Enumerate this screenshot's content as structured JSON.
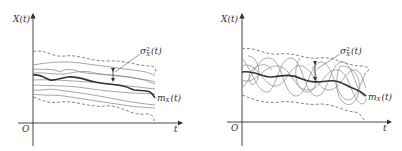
{
  "panels": [
    {
      "id": "left",
      "description": "Slowly varying sample functions of a random process",
      "y_axis_label": "X(t)",
      "x_axis_label": "t",
      "origin_label": "O",
      "variance_label": {
        "base": "σ",
        "sup": "2",
        "sub": "X",
        "arg": "(t)"
      },
      "mean_label": {
        "base": "m",
        "sub": "X",
        "arg": "(t)"
      },
      "colors": {
        "axis": "#333333",
        "sample": "#777777",
        "mean": "#333333",
        "envelope": "#666666"
      }
    },
    {
      "id": "right",
      "description": "Rapidly fluctuating sample functions of a random process",
      "y_axis_label": "X(t)",
      "x_axis_label": "t",
      "origin_label": "O",
      "variance_label": {
        "base": "σ",
        "sup": "2",
        "sub": "X",
        "arg": "(t)"
      },
      "mean_label": {
        "base": "m",
        "sub": "X",
        "arg": "(t)"
      },
      "colors": {
        "axis": "#333333",
        "sample": "#777777",
        "mean": "#333333",
        "envelope": "#666666"
      }
    }
  ]
}
